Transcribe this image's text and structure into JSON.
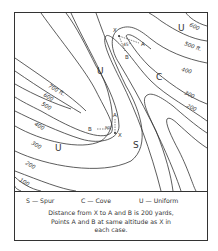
{
  "map": {
    "contour_labels": {
      "top_right_600": "600",
      "top_right_500": "500 ft.",
      "right_400": "400",
      "right_300": "300",
      "right_200": "200",
      "left_700": "700 ft.",
      "left_600": "600",
      "left_500": "500",
      "left_400": "400",
      "left_300": "300",
      "left_200": "200",
      "left_100": "100"
    },
    "region_labels": {
      "uniform_top_right": "U",
      "uniform_center": "U",
      "cove": "C",
      "uniform_bottom_left": "U",
      "spur": "S"
    },
    "cove_example": {
      "x_label": "X",
      "a_label": "A",
      "b_label": "B",
      "angle": "45°"
    },
    "spur_example": {
      "x_label": "X",
      "a_label": "A",
      "b_label": "B",
      "angle": "90°"
    }
  },
  "legend": {
    "spur": "S — Spur",
    "cove": "C — Cove",
    "uniform": "U — Uniform",
    "note_line1": "Distance  from X to A and B is  200 yards,",
    "note_line2": "Points  A  and B  at same  altitude as X in",
    "note_line3": "each case."
  },
  "colors": {
    "line": "#333333",
    "background": "#ffffff"
  }
}
